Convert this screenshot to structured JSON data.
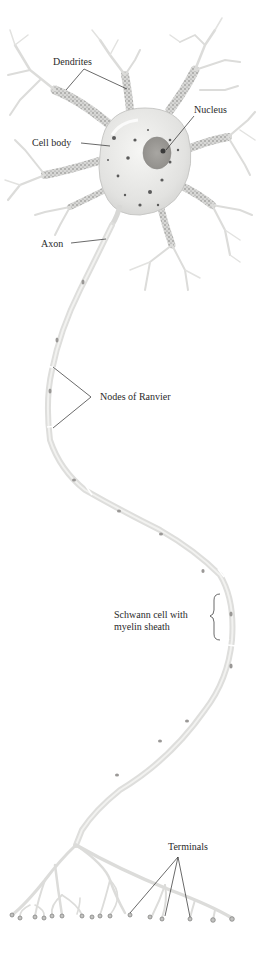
{
  "diagram": {
    "labels": {
      "dendrites": "Dendrites",
      "nucleus": "Nucleus",
      "cell_body": "Cell body",
      "axon": "Axon",
      "nodes_of_ranvier": "Nodes of Ranvier",
      "schwann_line1": "Schwann cell with",
      "schwann_line2": "myelin sheath",
      "terminals": "Terminals"
    },
    "colors": {
      "background": "#ffffff",
      "membrane": "#e4e4e2",
      "membrane_outline": "#c8c8c6",
      "stipple": "#6e6e6e",
      "nucleus": "#b0aeaa",
      "organelle": "#5a5a5a",
      "leader_line": "#2a2a2a"
    }
  }
}
